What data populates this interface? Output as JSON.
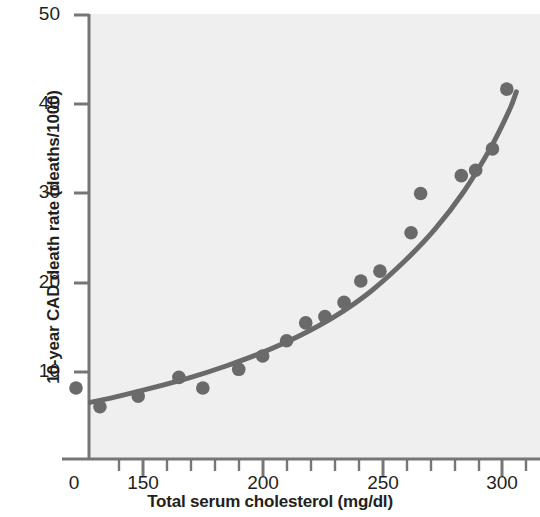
{
  "chart_data": {
    "type": "scatter",
    "title": "",
    "subtitle": "",
    "xlabel": "Total serum cholesterol (mg/dl)",
    "ylabel": "10-year CAD death rate (deaths/1000)",
    "xlim": [
      113,
      307
    ],
    "ylim": [
      0,
      50
    ],
    "xticks": [
      150,
      200,
      250,
      300
    ],
    "xtick_labels": [
      "150",
      "200",
      "250",
      "300"
    ],
    "x_axis_origin_label": "0",
    "x_minor_tick_step": 10,
    "yticks": [
      10,
      20,
      30,
      40,
      50
    ],
    "ytick_labels": [
      "10",
      "20",
      "30",
      "40",
      "50"
    ],
    "grid": false,
    "legend": null,
    "axis_break": true,
    "marker_color": "#6a6a6a",
    "line_color": "#6a6a6a",
    "plot_background": "#efefef",
    "axis_color": "#767676",
    "text_color": "#231f20",
    "series": [
      {
        "name": "Observed CAD death rate",
        "type": "scatter",
        "points": [
          {
            "x": 122,
            "y": 8.2
          },
          {
            "x": 132,
            "y": 6.1
          },
          {
            "x": 148,
            "y": 7.3
          },
          {
            "x": 165,
            "y": 9.4
          },
          {
            "x": 175,
            "y": 8.2
          },
          {
            "x": 190,
            "y": 10.3
          },
          {
            "x": 200,
            "y": 11.8
          },
          {
            "x": 210,
            "y": 13.5
          },
          {
            "x": 218,
            "y": 15.5
          },
          {
            "x": 226,
            "y": 16.2
          },
          {
            "x": 234,
            "y": 17.8
          },
          {
            "x": 241,
            "y": 20.2
          },
          {
            "x": 249,
            "y": 21.3
          },
          {
            "x": 262,
            "y": 25.6
          },
          {
            "x": 266,
            "y": 30.0
          },
          {
            "x": 283,
            "y": 32.0
          },
          {
            "x": 289,
            "y": 32.6
          },
          {
            "x": 296,
            "y": 35.0
          },
          {
            "x": 302,
            "y": 41.7
          }
        ]
      },
      {
        "name": "Fitted curve",
        "type": "line",
        "points": [
          {
            "x": 128,
            "y": 6.6
          },
          {
            "x": 140,
            "y": 7.3
          },
          {
            "x": 155,
            "y": 8.3
          },
          {
            "x": 170,
            "y": 9.4
          },
          {
            "x": 185,
            "y": 10.7
          },
          {
            "x": 200,
            "y": 12.2
          },
          {
            "x": 215,
            "y": 14.0
          },
          {
            "x": 230,
            "y": 16.2
          },
          {
            "x": 245,
            "y": 19.0
          },
          {
            "x": 260,
            "y": 22.6
          },
          {
            "x": 272,
            "y": 26.0
          },
          {
            "x": 284,
            "y": 30.2
          },
          {
            "x": 295,
            "y": 35.0
          },
          {
            "x": 303,
            "y": 39.3
          },
          {
            "x": 306,
            "y": 41.4
          }
        ]
      }
    ]
  }
}
